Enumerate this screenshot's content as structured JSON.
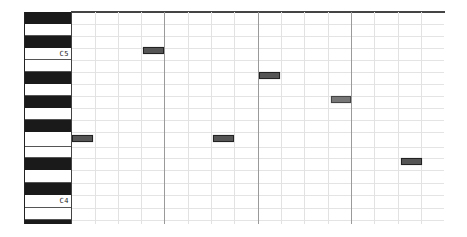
{
  "piano_roll": {
    "keys": [
      {
        "color": "black",
        "top": 0,
        "height": 12,
        "label": ""
      },
      {
        "color": "white",
        "top": 12,
        "height": 12,
        "label": ""
      },
      {
        "color": "black",
        "top": 24,
        "height": 12,
        "label": ""
      },
      {
        "color": "white",
        "top": 36,
        "height": 12,
        "label": "C5"
      },
      {
        "color": "white",
        "top": 48,
        "height": 12,
        "label": ""
      },
      {
        "color": "black",
        "top": 60,
        "height": 12,
        "label": ""
      },
      {
        "color": "white",
        "top": 72,
        "height": 12,
        "label": ""
      },
      {
        "color": "black",
        "top": 84,
        "height": 12,
        "label": ""
      },
      {
        "color": "white",
        "top": 96,
        "height": 12,
        "label": ""
      },
      {
        "color": "black",
        "top": 108,
        "height": 12,
        "label": ""
      },
      {
        "color": "white",
        "top": 120,
        "height": 15,
        "label": ""
      },
      {
        "color": "white",
        "top": 135,
        "height": 11,
        "label": ""
      },
      {
        "color": "black",
        "top": 146,
        "height": 12,
        "label": ""
      },
      {
        "color": "white",
        "top": 158,
        "height": 13,
        "label": ""
      },
      {
        "color": "black",
        "top": 171,
        "height": 12,
        "label": ""
      },
      {
        "color": "white",
        "top": 183,
        "height": 13,
        "label": "C4"
      },
      {
        "color": "white",
        "top": 196,
        "height": 12,
        "label": ""
      },
      {
        "color": "black",
        "top": 208,
        "height": 4,
        "label": ""
      }
    ],
    "row_lines": [
      12,
      24,
      36,
      48,
      60,
      72,
      84,
      96,
      108,
      120,
      135,
      146,
      158,
      171,
      183,
      196,
      208
    ],
    "beat_lines": [
      23,
      46,
      69,
      92,
      116,
      139,
      162,
      186,
      209,
      232,
      256,
      279,
      302,
      326,
      349
    ],
    "bar_lines": [
      92,
      186,
      279
    ],
    "notes": [
      {
        "left": 71,
        "top": 35,
        "width": 21,
        "selected": false
      },
      {
        "left": 187,
        "top": 60,
        "width": 21,
        "selected": false
      },
      {
        "left": 259,
        "top": 84,
        "width": 20,
        "selected": true
      },
      {
        "left": 0,
        "top": 123,
        "width": 21,
        "selected": false
      },
      {
        "left": 141,
        "top": 123,
        "width": 21,
        "selected": false
      },
      {
        "left": 329,
        "top": 146,
        "width": 21,
        "selected": false
      }
    ],
    "colors": {
      "note_fill": "#555555",
      "note_selected_fill": "#777777",
      "black_key": "#1a1a1a",
      "grid_line": "#e2e2e2",
      "bar_line": "#9a9a9a"
    }
  }
}
